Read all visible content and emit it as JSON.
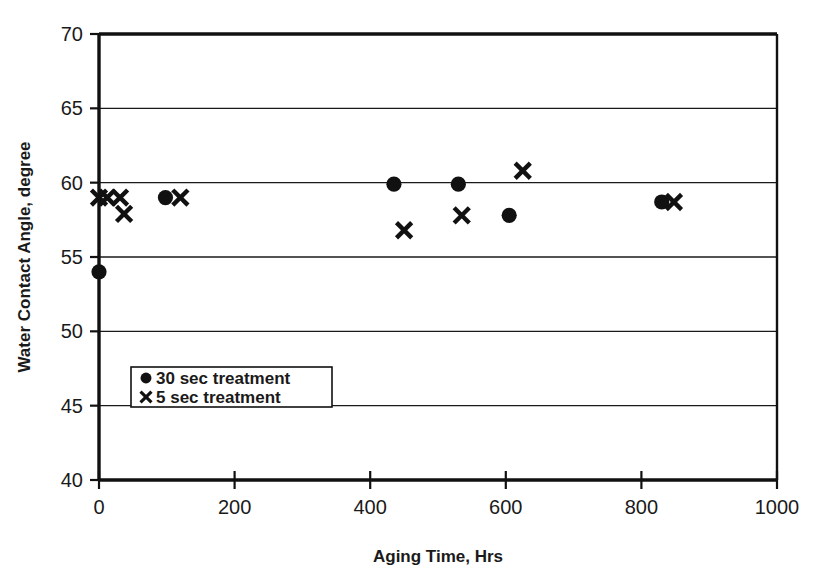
{
  "chart_data": {
    "type": "scatter",
    "title": "",
    "xlabel": "Aging Time, Hrs",
    "ylabel": "Water Contact Angle, degree",
    "xlim": [
      0,
      1000
    ],
    "ylim": [
      40,
      70
    ],
    "xticks": [
      "0",
      "200",
      "400",
      "600",
      "800",
      "1000"
    ],
    "xtick_values": [
      0,
      200,
      400,
      600,
      800,
      1000
    ],
    "yticks": [
      "40",
      "45",
      "50",
      "55",
      "60",
      "65",
      "70"
    ],
    "ytick_values": [
      40,
      45,
      50,
      55,
      60,
      65,
      70
    ],
    "grid": "horizontal",
    "legend_position": "lower-left-inside",
    "series": [
      {
        "name": "30 sec treatment",
        "marker": "circle",
        "color": "#111111",
        "points": [
          {
            "x": 0,
            "y": 54.0
          },
          {
            "x": 98,
            "y": 59.0
          },
          {
            "x": 435,
            "y": 59.9
          },
          {
            "x": 530,
            "y": 59.9
          },
          {
            "x": 605,
            "y": 57.8
          },
          {
            "x": 830,
            "y": 58.7
          }
        ]
      },
      {
        "name": "5 sec treatment",
        "marker": "x",
        "color": "#111111",
        "points": [
          {
            "x": 0,
            "y": 59.0
          },
          {
            "x": 12,
            "y": 59.0
          },
          {
            "x": 31,
            "y": 59.0
          },
          {
            "x": 37,
            "y": 57.9
          },
          {
            "x": 120,
            "y": 59.0
          },
          {
            "x": 450,
            "y": 56.8
          },
          {
            "x": 535,
            "y": 57.8
          },
          {
            "x": 625,
            "y": 60.8
          },
          {
            "x": 848,
            "y": 58.7
          }
        ]
      }
    ]
  },
  "legend": {
    "items": [
      {
        "marker": "circle",
        "label": "30 sec treatment"
      },
      {
        "marker": "x",
        "label": "5 sec treatment"
      }
    ]
  }
}
